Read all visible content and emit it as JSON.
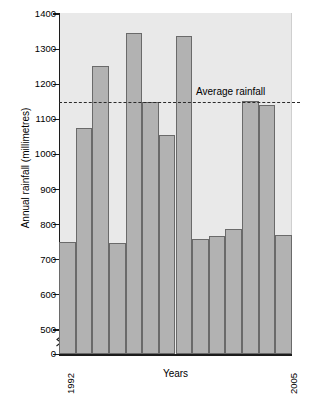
{
  "chart_data": {
    "type": "bar",
    "title": "",
    "xlabel": "Years",
    "ylabel": "Annual rainfall (millimetres)",
    "categories": [
      "1992",
      "1993",
      "1994",
      "1995",
      "1996",
      "1997",
      "1998",
      "1999",
      "2000",
      "2001",
      "2002",
      "2003",
      "2004",
      "2005"
    ],
    "values": [
      752,
      1076,
      1251,
      748,
      1345,
      1150,
      1055,
      1336,
      760,
      767,
      788,
      1151,
      1140,
      771
    ],
    "ylim": [
      0,
      1400
    ],
    "yticks": [
      0,
      500,
      600,
      700,
      800,
      900,
      1000,
      1100,
      1200,
      1300,
      1400
    ],
    "ytick_labels": [
      "0",
      "500",
      "600",
      "700",
      "800",
      "900",
      "1000",
      "1100",
      "1200",
      "1300",
      "1400"
    ],
    "axis_break": true,
    "axis_break_between": [
      0,
      500
    ],
    "grid": false,
    "legend": "none",
    "visible_x_tick_labels": [
      "1992",
      "2005"
    ],
    "annotations": [
      {
        "name": "average-rainfall-line",
        "label": "Average rainfall",
        "value": 1150,
        "style": "dashed-horizontal"
      }
    ],
    "colors": {
      "bar_fill": "#b2b2b2",
      "bar_stroke": "#6a6a6a",
      "plot_background": "#e9e9e9",
      "axis": "#1c1c1c",
      "average_line": "#2a2a2a",
      "page_background": "#ffffff"
    }
  },
  "axis": {
    "y_title": "Annual rainfall (millimetres)",
    "x_title": "Years",
    "x_first": "1992",
    "x_last": "2005"
  },
  "annotation": {
    "average_label": "Average rainfall"
  }
}
